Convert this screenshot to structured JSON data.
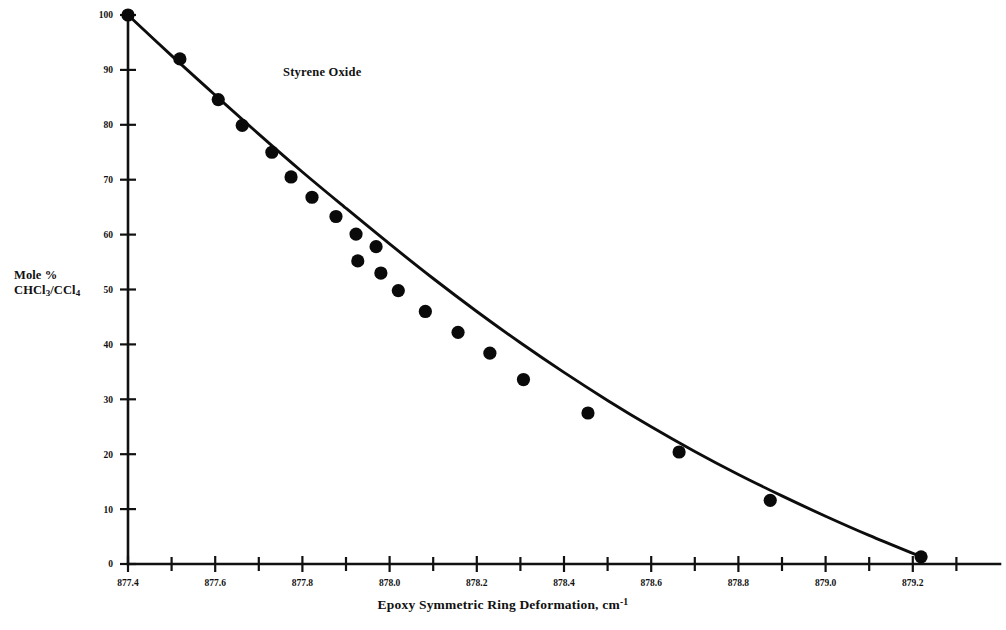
{
  "chart_data": {
    "type": "scatter",
    "title": "",
    "annotation": "Styrene Oxide",
    "xlabel_main": "Epoxy Symmetric Ring Deformation, cm",
    "xlabel_exponent": "-1",
    "ylabel_line1": "Mole %",
    "ylabel_line2_pre": "CHCl",
    "ylabel_line2_sub1": "3",
    "ylabel_line2_mid": "/CCl",
    "ylabel_line2_sub2": "4",
    "xlim": [
      877.4,
      879.4
    ],
    "ylim": [
      0,
      100
    ],
    "x_major_ticks": [
      877.4,
      877.6,
      877.8,
      878.0,
      878.2,
      878.4,
      878.6,
      878.8,
      879.0,
      879.2
    ],
    "x_major_tick_labels": [
      "877.4",
      "877.6",
      "877.8",
      "878.0",
      "878.2",
      "878.4",
      "878.6",
      "878.8",
      "879.0",
      "879.2"
    ],
    "x_minor_ticks": [
      877.5,
      877.7,
      877.9,
      878.1,
      878.3,
      878.5,
      878.7,
      878.9,
      879.1,
      879.3
    ],
    "y_ticks": [
      0,
      10,
      20,
      30,
      40,
      50,
      60,
      70,
      80,
      90,
      100
    ],
    "y_tick_labels": [
      "0",
      "10",
      "20",
      "30",
      "40",
      "50",
      "60",
      "70",
      "80",
      "90",
      "100"
    ],
    "grid": false,
    "legend": false,
    "marker_color": "#0a0a0a",
    "line_color": "#0d0d0d",
    "axis_color": "#111111",
    "x": [
      877.4,
      877.519,
      877.607,
      877.662,
      877.73,
      877.774,
      877.822,
      877.877,
      877.923,
      877.969,
      878.011,
      878.027,
      878.05,
      878.09,
      878.107,
      878.14,
      878.187,
      878.232,
      878.285,
      878.362,
      878.47,
      878.575,
      878.7,
      878.885,
      879.21
    ],
    "y": [
      100.0,
      92.0,
      84.6,
      79.9,
      75.0,
      70.5,
      66.8,
      63.3,
      60.1,
      57.8,
      55.2,
      53.0,
      52.0,
      49.8,
      46.0,
      46.1,
      42.2,
      38.4,
      33.6,
      33.7,
      27.5,
      27.6,
      20.4,
      11.6,
      1.3
    ],
    "points": [
      {
        "x": 877.4,
        "y": 100.0
      },
      {
        "x": 877.519,
        "y": 92.0
      },
      {
        "x": 877.607,
        "y": 84.6
      },
      {
        "x": 877.662,
        "y": 79.9
      },
      {
        "x": 877.73,
        "y": 75.0
      },
      {
        "x": 877.774,
        "y": 70.5
      },
      {
        "x": 877.822,
        "y": 66.8
      },
      {
        "x": 877.877,
        "y": 63.3
      },
      {
        "x": 877.923,
        "y": 60.1
      },
      {
        "x": 877.969,
        "y": 57.8
      },
      {
        "x": 877.927,
        "y": 55.2
      },
      {
        "x": 877.98,
        "y": 53.0
      },
      {
        "x": 878.02,
        "y": 49.8
      },
      {
        "x": 878.082,
        "y": 46.0
      },
      {
        "x": 878.157,
        "y": 42.2
      },
      {
        "x": 878.23,
        "y": 38.4
      },
      {
        "x": 878.307,
        "y": 33.6
      },
      {
        "x": 878.455,
        "y": 27.5
      },
      {
        "x": 878.664,
        "y": 20.4
      },
      {
        "x": 878.873,
        "y": 11.6
      },
      {
        "x": 879.219,
        "y": 1.3
      }
    ],
    "fit_curve": [
      {
        "x": 877.4,
        "y": 100.0
      },
      {
        "x": 877.5,
        "y": 92.6
      },
      {
        "x": 877.6,
        "y": 85.4
      },
      {
        "x": 877.7,
        "y": 78.3
      },
      {
        "x": 877.8,
        "y": 71.4
      },
      {
        "x": 877.9,
        "y": 64.8
      },
      {
        "x": 878.0,
        "y": 58.3
      },
      {
        "x": 878.1,
        "y": 52.0
      },
      {
        "x": 878.2,
        "y": 46.0
      },
      {
        "x": 878.3,
        "y": 40.3
      },
      {
        "x": 878.4,
        "y": 34.9
      },
      {
        "x": 878.5,
        "y": 29.8
      },
      {
        "x": 878.6,
        "y": 25.0
      },
      {
        "x": 878.7,
        "y": 20.5
      },
      {
        "x": 878.8,
        "y": 16.3
      },
      {
        "x": 878.9,
        "y": 12.4
      },
      {
        "x": 879.0,
        "y": 8.7
      },
      {
        "x": 879.1,
        "y": 5.2
      },
      {
        "x": 879.219,
        "y": 1.3
      }
    ]
  }
}
